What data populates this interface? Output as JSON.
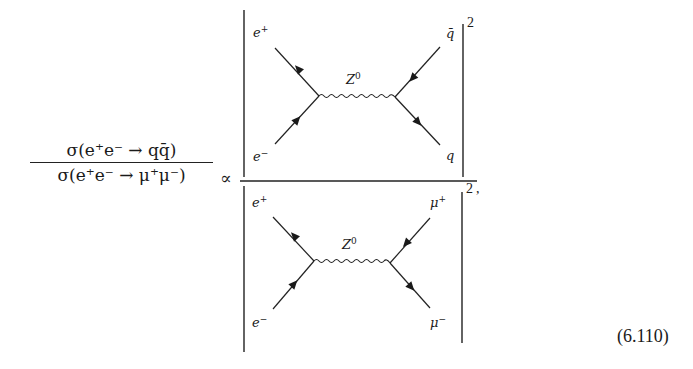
{
  "equation": {
    "numerator": "σ(e⁺e⁻ → qq̄)",
    "denominator": "σ(e⁺e⁻ → μ⁺μ⁻)",
    "relation": "∝",
    "number": "(6.110)",
    "trailing_punct": ","
  },
  "diagrams": {
    "top": {
      "in_top": "e",
      "in_top_sup": "+",
      "in_bottom": "e",
      "in_bottom_sup": "−",
      "out_top": "q̄",
      "out_bottom": "q",
      "propagator": "Z",
      "propagator_sup": "0",
      "exponent": "2"
    },
    "bottom": {
      "in_top": "e",
      "in_top_sup": "+",
      "in_bottom": "e",
      "in_bottom_sup": "−",
      "out_top": "μ",
      "out_top_sup": "+",
      "out_bottom": "μ",
      "out_bottom_sup": "−",
      "propagator": "Z",
      "propagator_sup": "0",
      "exponent": "2"
    }
  }
}
